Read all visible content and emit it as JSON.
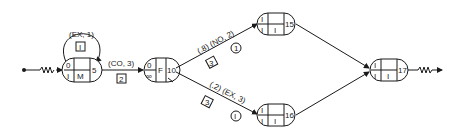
{
  "diagram": {
    "type": "network",
    "colors": {
      "ink": "#1a1a1a",
      "background": "#ffffff"
    },
    "nodes": [
      {
        "id": "n5",
        "number": "5",
        "top_left": "0",
        "bottom_left": "I",
        "center_top": "",
        "center_bottom": "M"
      },
      {
        "id": "n10",
        "number": "10",
        "top_left": "0",
        "bottom_left": "∞",
        "center": "F"
      },
      {
        "id": "n15",
        "number": "15",
        "top_left": "I",
        "bottom_left": "I",
        "center_top": "",
        "center_bottom": "I"
      },
      {
        "id": "n16",
        "number": "16",
        "top_left": "I",
        "bottom_left": "I",
        "center_top": "",
        "center_bottom": "I"
      },
      {
        "id": "n17",
        "number": "17",
        "top_left": "I",
        "bottom_left": "I",
        "center_top": "",
        "center_bottom": "I"
      }
    ],
    "edges": [
      {
        "from": "n5",
        "to": "n5",
        "label": "(EX, 1)",
        "box": "I"
      },
      {
        "from": "n5",
        "to": "n10",
        "label": "(CO, 3)",
        "box": "2"
      },
      {
        "from": "n10",
        "to": "n15",
        "label": "(.8) (NO, 2)",
        "box": "3",
        "circle": "1"
      },
      {
        "from": "n10",
        "to": "n16",
        "label": "(.2) (EX, 3)",
        "box": "3",
        "circle": "I"
      },
      {
        "from": "n15",
        "to": "n17"
      },
      {
        "from": "n16",
        "to": "n17"
      }
    ],
    "source": {
      "type": "squiggle-arrow"
    },
    "sink": {
      "type": "squiggle-arrow"
    }
  }
}
